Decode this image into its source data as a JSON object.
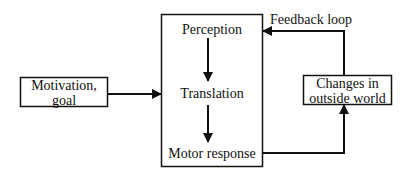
{
  "diagram": {
    "nodes": {
      "motivation": {
        "line1": "Motivation,",
        "line2": "goal"
      },
      "main_stages": {
        "perception": "Perception",
        "translation": "Translation",
        "motor_response": "Motor response"
      },
      "changes": {
        "line1": "Changes in",
        "line2": "outside world"
      }
    },
    "edges": {
      "feedback_label": "Feedback loop"
    }
  }
}
